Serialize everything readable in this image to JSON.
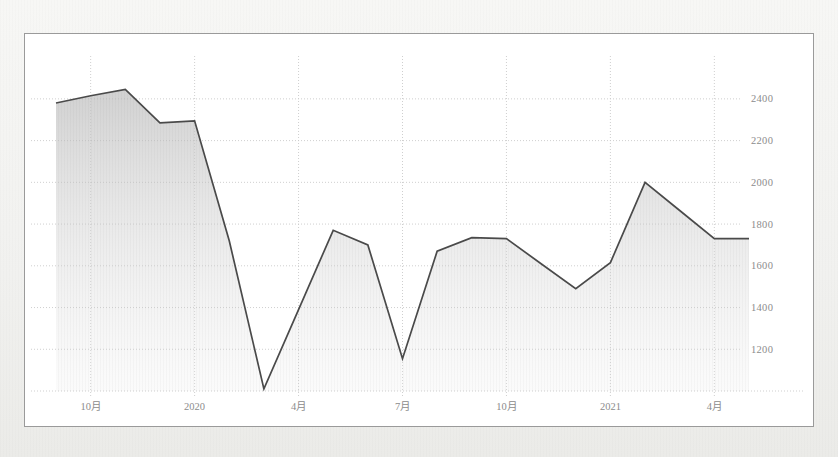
{
  "panel": {
    "background_color": "#ffffff",
    "border_color": "#9a9a9a",
    "outer_background_color": "#f2f2f0"
  },
  "chart_data": {
    "type": "area",
    "title": "",
    "subtitle": "",
    "xlabel": "",
    "ylabel": "",
    "legend": [],
    "legend_position": "none",
    "grid": true,
    "grid_style": "dotted",
    "y_axis_position": "right",
    "line_color": "#4a4a4a",
    "fill_color": "#d8d8d8",
    "grid_color": "#c9c9c9",
    "axis_text_color": "#8c8c8c",
    "ylim": [
      1000,
      2500
    ],
    "yticks": [
      1200,
      1400,
      1600,
      1800,
      2000,
      2200,
      2400
    ],
    "ytick_labels": [
      "1200",
      "1400",
      "1600",
      "1800",
      "2000",
      "2200",
      "2400"
    ],
    "xticks": [
      "2019-10",
      "2020-01",
      "2020-04",
      "2020-07",
      "2020-10",
      "2021-01",
      "2021-04"
    ],
    "xtick_labels": [
      "10月",
      "2020",
      "4月",
      "7月",
      "10月",
      "2021",
      "4月"
    ],
    "x": [
      "2019-09",
      "2019-10",
      "2019-11",
      "2019-12",
      "2020-01",
      "2020-02",
      "2020-03",
      "2020-04",
      "2020-05",
      "2020-06",
      "2020-07",
      "2020-08",
      "2020-09",
      "2020-10",
      "2020-11",
      "2020-12",
      "2021-01",
      "2021-02",
      "2021-03",
      "2021-04",
      "2021-05"
    ],
    "values": [
      2380,
      2415,
      2445,
      2285,
      2295,
      1720,
      1010,
      1390,
      1770,
      1700,
      1155,
      1670,
      1735,
      1730,
      1610,
      1490,
      1615,
      2000,
      1865,
      1730,
      1730
    ],
    "series": [
      {
        "name": "series-1",
        "values": [
          2380,
          2415,
          2445,
          2285,
          2295,
          1720,
          1010,
          1390,
          1770,
          1700,
          1155,
          1670,
          1735,
          1730,
          1610,
          1490,
          1615,
          2000,
          1865,
          1730,
          1730
        ]
      }
    ]
  }
}
